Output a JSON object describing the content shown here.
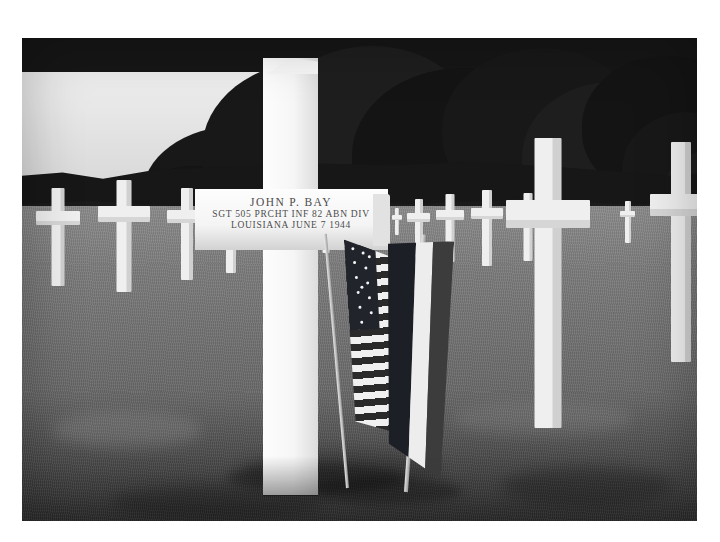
{
  "photograph": {
    "title": "Grave marker of John P. Bay, Normandy American Cemetery",
    "medium": "black-and-white photograph",
    "alt": "A white marble Latin cross grave marker in a military cemetery, with an American flag and a French flag planted at its base, and rows of identical crosses receding into the distance beneath a dark treeline."
  },
  "marker_inscription": {
    "name": "JOHN P. BAY",
    "unit": "SGT   505 PRCHT INF  82 ABN DIV",
    "state_and_date": "LOUISIANA   JUNE 7 1944"
  },
  "flags": [
    {
      "name": "american-flag",
      "label": "United States flag",
      "stars": 13
    },
    {
      "name": "french-flag",
      "label": "French tricolor flag",
      "bands": [
        "blue",
        "white",
        "red"
      ]
    }
  ],
  "scene": {
    "sky_tone": "#ebebeb",
    "treeline_tone": "#181818",
    "grass_near_tone": "#3a3a3a",
    "grass_far_tone": "#8d8d8d",
    "marker_stone_tone": "#f5f5f5",
    "border_tone": "#ffffff"
  },
  "background_crosses": {
    "left_row_count": 11,
    "right_row_count": 9,
    "description": "Rows of uniform white crosses receding toward the treeline on both sides of the foreground marker."
  }
}
